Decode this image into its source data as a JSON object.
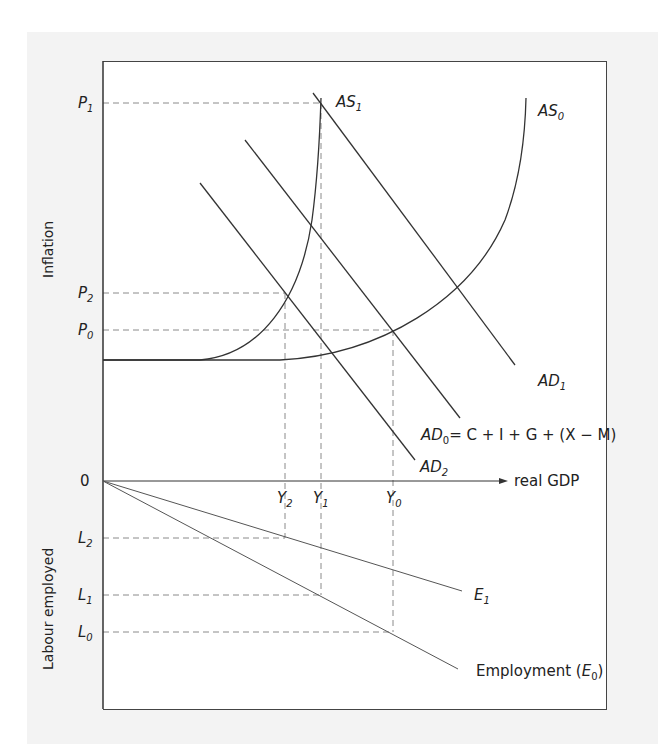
{
  "diagram": {
    "title": "",
    "axes": {
      "upper_y_label": "Inflation",
      "lower_y_label": "Labour employed",
      "x_label": "real GDP",
      "origin_label": "0"
    },
    "price_levels": [
      {
        "id": "P1",
        "main": "P",
        "sub": "1"
      },
      {
        "id": "P2",
        "main": "P",
        "sub": "2"
      },
      {
        "id": "P0",
        "main": "P",
        "sub": "0"
      }
    ],
    "output_levels": [
      {
        "id": "Y2",
        "main": "Y",
        "sub": "2"
      },
      {
        "id": "Y1",
        "main": "Y",
        "sub": "1"
      },
      {
        "id": "Y0",
        "main": "Y",
        "sub": "0"
      }
    ],
    "labour_levels": [
      {
        "id": "L2",
        "main": "L",
        "sub": "2"
      },
      {
        "id": "L1",
        "main": "L",
        "sub": "1"
      },
      {
        "id": "L0",
        "main": "L",
        "sub": "0"
      }
    ],
    "curves": {
      "as1": {
        "main": "AS",
        "sub": "1"
      },
      "as0": {
        "main": "AS",
        "sub": "0"
      },
      "ad1": {
        "main": "AD",
        "sub": "1"
      },
      "ad0": {
        "main": "AD",
        "sub": "0",
        "suffix": "= C + I + G + (X − M)"
      },
      "ad2": {
        "main": "AD",
        "sub": "2"
      },
      "e1": {
        "main": "E",
        "sub": "1"
      },
      "e0": {
        "prefix": "Employment (",
        "main": "E",
        "sub": "0",
        "suffix": ")"
      }
    },
    "colors": {
      "line": "#333333",
      "dashed": "#888888",
      "panel": "#f3f3f3",
      "frame_bg": "#ffffff"
    }
  }
}
